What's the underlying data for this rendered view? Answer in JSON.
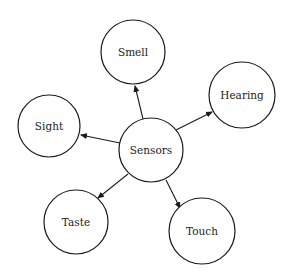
{
  "diagram": {
    "type": "radial-concept-map",
    "center": {
      "id": "sensors",
      "label": "Sensors",
      "cx": 151,
      "cy": 150,
      "r": 32
    },
    "nodes": [
      {
        "id": "smell",
        "label": "Smell",
        "cx": 133,
        "cy": 52,
        "r": 32
      },
      {
        "id": "hearing",
        "label": "Hearing",
        "cx": 242,
        "cy": 95,
        "r": 33
      },
      {
        "id": "sight",
        "label": "Sight",
        "cx": 49,
        "cy": 126,
        "r": 31
      },
      {
        "id": "taste",
        "label": "Taste",
        "cx": 76,
        "cy": 222,
        "r": 32
      },
      {
        "id": "touch",
        "label": "Touch",
        "cx": 202,
        "cy": 231,
        "r": 33
      }
    ],
    "edges": [
      {
        "from": "sensors",
        "to": "smell",
        "x1": 143,
        "y1": 119,
        "x2": 135,
        "y2": 86
      },
      {
        "from": "sensors",
        "to": "hearing",
        "x1": 176,
        "y1": 130,
        "x2": 212,
        "y2": 112
      },
      {
        "from": "sensors",
        "to": "sight",
        "x1": 120,
        "y1": 143,
        "x2": 81,
        "y2": 135
      },
      {
        "from": "sensors",
        "to": "taste",
        "x1": 128,
        "y1": 174,
        "x2": 98,
        "y2": 198
      },
      {
        "from": "sensors",
        "to": "touch",
        "x1": 166,
        "y1": 180,
        "x2": 180,
        "y2": 208
      }
    ],
    "colors": {
      "stroke": "#1a1a1a",
      "fill": "#ffffff",
      "text": "#222222"
    }
  }
}
